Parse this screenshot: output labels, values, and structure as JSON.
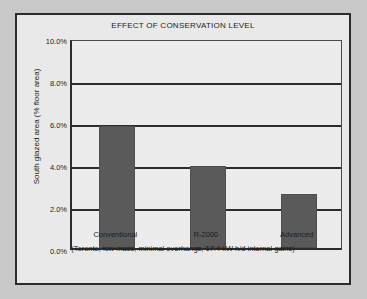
{
  "chart_data": {
    "type": "bar",
    "title": "EFFECT OF CONSERVATION LEVEL",
    "categories": [
      "Conventional",
      "R-2000",
      "Advanced"
    ],
    "values": [
      5.8,
      3.9,
      2.55
    ],
    "xlabel": "(Toronto, low mass, minimal overhangs, 17.4 kW h/d internal gains)",
    "ylabel": "South glazed area (% floor area)",
    "ylim": [
      0.0,
      10.0
    ],
    "ytick_labels": [
      "0.0%",
      "2.0%",
      "4.0%",
      "6.0%",
      "8.0%",
      "10.0%"
    ],
    "ytick_values": [
      0.0,
      2.0,
      4.0,
      6.0,
      8.0,
      10.0
    ],
    "grid": true,
    "legend": false,
    "bar_color": "#5a5a5a",
    "axis_color": "#2c2c2c",
    "plot_background": "#ececec",
    "figure_background": "#e9e9e9"
  }
}
